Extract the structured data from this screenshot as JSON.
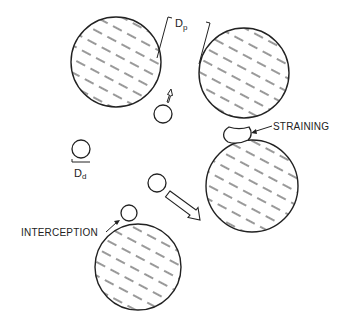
{
  "diagram": {
    "colors": {
      "stroke": "#222222",
      "background": "#ffffff",
      "hatch": "#333333"
    },
    "grains": [
      {
        "id": "grain-top-left",
        "cx": 116,
        "cy": 62,
        "r": 45
      },
      {
        "id": "grain-top-right",
        "cx": 244,
        "cy": 73,
        "r": 45
      },
      {
        "id": "grain-right-middle",
        "cx": 252,
        "cy": 186,
        "r": 46
      },
      {
        "id": "grain-bottom-left",
        "cx": 138,
        "cy": 267,
        "r": 43
      }
    ],
    "particles": [
      {
        "id": "particle-moving-up",
        "cx": 163,
        "cy": 114,
        "r": 9
      },
      {
        "id": "particle-reference",
        "cx": 81,
        "cy": 149,
        "r": 9
      },
      {
        "id": "particle-moving-down-right",
        "cx": 157,
        "cy": 183,
        "r": 9
      },
      {
        "id": "particle-intercepted",
        "cx": 129,
        "cy": 213,
        "r": 8
      }
    ],
    "labels": {
      "grain_diameter": "D",
      "grain_diameter_sub": "p",
      "particle_diameter": "D",
      "particle_diameter_sub": "d",
      "straining": "STRAINING",
      "interception": "INTERCEPTION"
    }
  }
}
